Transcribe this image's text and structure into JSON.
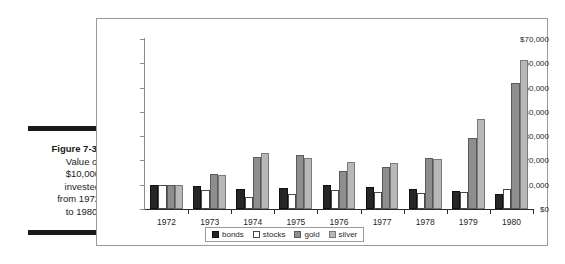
{
  "caption": {
    "figure_label": "Figure 7-3:",
    "lines": [
      "Value of",
      "$10,000",
      "invested",
      "from 1972",
      "to 1980."
    ]
  },
  "chart_data": {
    "type": "bar",
    "title": "",
    "xlabel": "",
    "ylabel": "",
    "grid": false,
    "legend_position": "bottom",
    "ylim": [
      0,
      70000
    ],
    "ytick_values": [
      0,
      10000,
      20000,
      30000,
      40000,
      50000,
      60000,
      70000
    ],
    "ytick_labels": [
      "$0",
      "$10,000",
      "$20,000",
      "$30,000",
      "$40,000",
      "$50,000",
      "$60,000",
      "$70,000"
    ],
    "categories": [
      "1972",
      "1973",
      "1974",
      "1975",
      "1976",
      "1977",
      "1978",
      "1979",
      "1980"
    ],
    "series": [
      {
        "name": "bonds",
        "color": "#262626",
        "values": [
          9900,
          9300,
          8200,
          8600,
          10000,
          9200,
          8400,
          7500,
          6300
        ]
      },
      {
        "name": "stocks",
        "color": "#ffffff",
        "values": [
          9900,
          7700,
          5100,
          6300,
          8000,
          6800,
          6500,
          7000,
          8200
        ]
      },
      {
        "name": "gold",
        "color": "#8e8e8e",
        "values": [
          9900,
          14500,
          21500,
          22100,
          15500,
          17400,
          21200,
          29300,
          51800
        ]
      },
      {
        "name": "silver",
        "color": "#b8b8b8",
        "values": [
          9900,
          14000,
          23100,
          20800,
          19500,
          19000,
          20400,
          37200,
          61200
        ]
      }
    ],
    "legend": [
      "bonds",
      "stocks",
      "gold",
      "silver"
    ]
  }
}
